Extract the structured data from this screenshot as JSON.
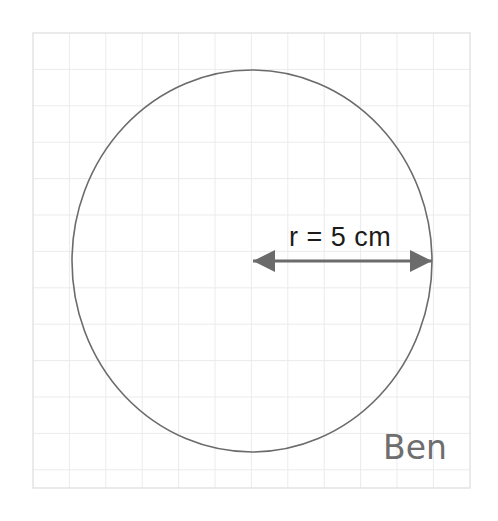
{
  "worksheet": {
    "background_color": "#ffffff",
    "paper": {
      "name": "graph-paper",
      "grid_color": "#ebebeb",
      "border_color": "#e2e2e2",
      "x": 33,
      "y": 33,
      "width": 437,
      "height": 455,
      "cell_size": 36.4,
      "columns": 12,
      "rows": 12.5
    }
  },
  "figure": {
    "shape_name": "circle",
    "stroke_color": "#6b6b6b",
    "stroke_width": 1.6,
    "center_x": 252,
    "center_y": 261,
    "radius_x": 180,
    "radius_y": 191
  },
  "annotation": {
    "radius_label": "r = 5 cm",
    "label_x": 289,
    "label_y": 246,
    "arrow": {
      "name": "double-headed-radius-arrow",
      "color": "#6b6b6b",
      "x1": 253,
      "x2": 432,
      "y": 261,
      "head_size": 11
    }
  },
  "signature": {
    "text": "Ben",
    "x": 383,
    "y": 459,
    "color": "#6e6e6e"
  },
  "chart_data": {
    "type": "diagram",
    "title": "",
    "subtitle": "",
    "shapes": [
      {
        "kind": "circle",
        "center": [
          252,
          261
        ],
        "radius_px": 180,
        "radius_value": 5,
        "radius_unit": "cm"
      }
    ],
    "annotations": [
      {
        "kind": "dimension-arrow",
        "label": "r = 5 cm",
        "from": [
          252,
          261
        ],
        "to": [
          432,
          261
        ],
        "measures": "radius"
      },
      {
        "kind": "handwritten-signature",
        "label": "Ben",
        "position": [
          383,
          459
        ]
      }
    ],
    "grid": {
      "on": true,
      "cell_size_px": 36.4,
      "columns": 12,
      "rows": 12.5
    },
    "xlabel": "",
    "ylabel": "",
    "legend": []
  }
}
